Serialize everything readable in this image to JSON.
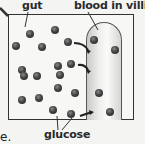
{
  "diagram": {
    "labels": {
      "gut": "gut",
      "blood": "blood in villi",
      "glucose": "glucose",
      "trailing_text": "e."
    },
    "colors": {
      "molecule": "#333333",
      "outline": "#333333",
      "villus_fill": "#e8e8e6"
    },
    "molecules": [
      {
        "x": 30,
        "y": 34
      },
      {
        "x": 55,
        "y": 30
      },
      {
        "x": 16,
        "y": 46
      },
      {
        "x": 42,
        "y": 47
      },
      {
        "x": 68,
        "y": 42
      },
      {
        "x": 94,
        "y": 40
      },
      {
        "x": 115,
        "y": 50
      },
      {
        "x": 22,
        "y": 70
      },
      {
        "x": 58,
        "y": 66
      },
      {
        "x": 71,
        "y": 64
      },
      {
        "x": 60,
        "y": 75
      },
      {
        "x": 24,
        "y": 76
      },
      {
        "x": 37,
        "y": 76
      },
      {
        "x": 58,
        "y": 88
      },
      {
        "x": 75,
        "y": 93
      },
      {
        "x": 99,
        "y": 93
      },
      {
        "x": 22,
        "y": 100
      },
      {
        "x": 39,
        "y": 98
      },
      {
        "x": 53,
        "y": 110
      },
      {
        "x": 71,
        "y": 114
      },
      {
        "x": 110,
        "y": 112
      }
    ]
  }
}
